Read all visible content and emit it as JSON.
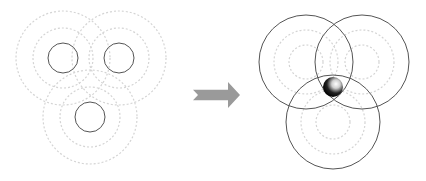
{
  "colors": {
    "background": "#ffffff",
    "solid_stroke": "#555555",
    "dashed_stroke": "#d4d4d4",
    "arrow_fill": "#9a9a9a",
    "ball_dark": "#000000",
    "ball_light": "#ffffff"
  },
  "left_panel": {
    "label": "signal ranges (before)",
    "stations": [
      {
        "cx": 63,
        "cy": 58,
        "r_solid": 15,
        "r_dashed": [
          30,
          47
        ]
      },
      {
        "cx": 119,
        "cy": 58,
        "r_solid": 15,
        "r_dashed": [
          30,
          47
        ]
      },
      {
        "cx": 90,
        "cy": 117,
        "r_solid": 15,
        "r_dashed": [
          30,
          47
        ]
      }
    ]
  },
  "arrow": {
    "icon": "right-arrow-icon",
    "x": 193,
    "y": 82,
    "width": 47,
    "height": 26
  },
  "right_panel": {
    "label": "trilateration (after)",
    "stations": [
      {
        "cx": 306,
        "cy": 62,
        "r_solid": 47,
        "r_dashed": [
          17,
          32
        ]
      },
      {
        "cx": 362,
        "cy": 62,
        "r_solid": 47,
        "r_dashed": [
          17,
          32
        ]
      },
      {
        "cx": 333,
        "cy": 122,
        "r_solid": 47,
        "r_dashed": [
          17,
          32
        ]
      }
    ],
    "target": {
      "icon": "sphere-icon",
      "cx": 333,
      "cy": 87,
      "r": 10
    }
  }
}
